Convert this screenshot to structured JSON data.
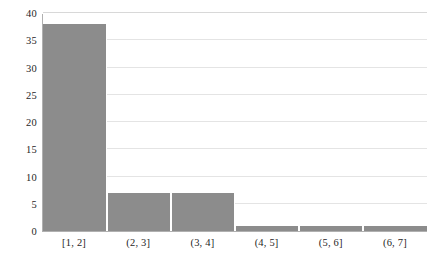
{
  "chart_data": {
    "type": "bar",
    "title": "",
    "subtitle": "",
    "xlabel": "",
    "ylabel": "",
    "categories": [
      "[1, 2]",
      "(2, 3]",
      "(3, 4]",
      "(4, 5]",
      "(5, 6]",
      "(6, 7]"
    ],
    "values": [
      38,
      7,
      7,
      1,
      1,
      1
    ],
    "ylim": [
      0,
      40
    ],
    "ytick_values": [
      0,
      5,
      10,
      15,
      20,
      25,
      30,
      35,
      40
    ],
    "ytick_labels": [
      "0",
      "5",
      "10",
      "15",
      "20",
      "25",
      "30",
      "35",
      "40"
    ],
    "grid": true,
    "grid_axis": "y",
    "legend": false,
    "legend_position": "none",
    "bar_color": "#8c8c8c",
    "bar_separator_color": "#ffffff",
    "gridline_color": "#e4e4e4",
    "axis_color": "#b0b0b0",
    "background_color": "#ffffff",
    "text_color": "#1f1f1f"
  }
}
